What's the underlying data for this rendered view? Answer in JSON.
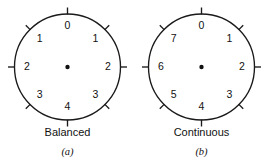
{
  "figure": {
    "background_color": "#ffffff",
    "stroke_color": "#1a1a1a",
    "text_color": "#111111"
  },
  "chart_data": {
    "type": "diagram",
    "title": "",
    "subtitle": "",
    "panels": [
      {
        "id": "a",
        "caption": "Balanced",
        "subcaption": "(a)",
        "center_marker": "dot",
        "tick_count": 8,
        "tick_step_degrees": 45,
        "labels": [
          "0",
          "1",
          "2",
          "3",
          "4",
          "3",
          "2",
          "1"
        ],
        "label_angles_deg_cw_from_top": [
          0,
          45,
          90,
          135,
          180,
          225,
          270,
          315
        ]
      },
      {
        "id": "b",
        "caption": "Continuous",
        "subcaption": "(b)",
        "center_marker": "dot",
        "tick_count": 8,
        "tick_step_degrees": 45,
        "labels": [
          "0",
          "1",
          "2",
          "3",
          "4",
          "5",
          "6",
          "7"
        ],
        "label_angles_deg_cw_from_top": [
          0,
          45,
          90,
          135,
          180,
          225,
          270,
          315
        ]
      }
    ]
  }
}
